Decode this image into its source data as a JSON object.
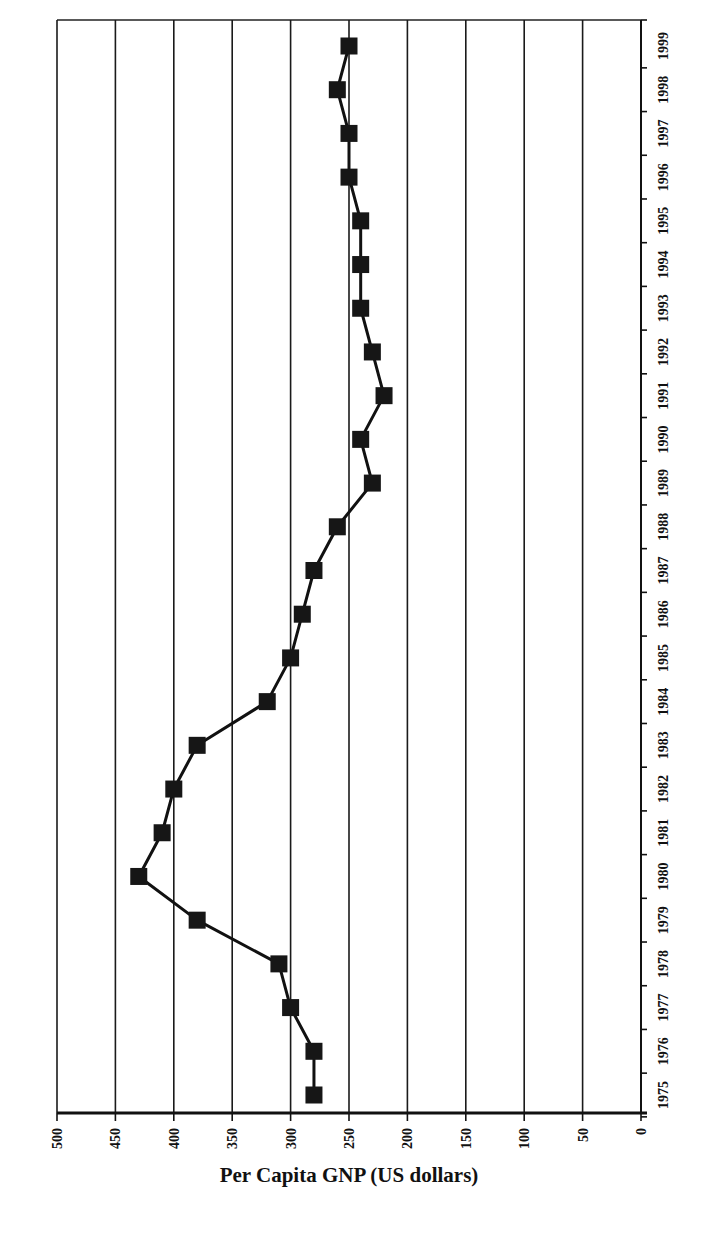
{
  "chart_data": {
    "type": "line",
    "orientation": "rotated-90",
    "title": "",
    "xlabel": "Per Capita GNP (US dollars)",
    "ylabel": "",
    "value_axis": {
      "label": "Per Capita GNP (US dollars)",
      "range": [
        0,
        500
      ],
      "reversed": true,
      "ticks": [
        500,
        450,
        400,
        350,
        300,
        250,
        200,
        150,
        100,
        50,
        0
      ]
    },
    "category_axis": {
      "position": "right",
      "categories": [
        "1975",
        "1976",
        "1977",
        "1978",
        "1979",
        "1980",
        "1981",
        "1982",
        "1983",
        "1984",
        "1985",
        "1986",
        "1987",
        "1988",
        "1989",
        "1990",
        "1991",
        "1992",
        "1993",
        "1994",
        "1995",
        "1996",
        "1997",
        "1998",
        "1999"
      ]
    },
    "categories": [
      "1975",
      "1976",
      "1977",
      "1978",
      "1979",
      "1980",
      "1981",
      "1982",
      "1983",
      "1984",
      "1985",
      "1986",
      "1987",
      "1988",
      "1989",
      "1990",
      "1991",
      "1992",
      "1993",
      "1994",
      "1995",
      "1996",
      "1997",
      "1998",
      "1999"
    ],
    "series": [
      {
        "name": "Per Capita GNP",
        "marker": "square",
        "color": "#111111",
        "values": [
          280,
          280,
          300,
          310,
          380,
          430,
          410,
          400,
          380,
          320,
          300,
          290,
          280,
          260,
          230,
          240,
          220,
          230,
          240,
          240,
          240,
          250,
          250,
          260,
          250
        ]
      }
    ],
    "grid": true,
    "legend": null
  },
  "axis_title": "Per Capita GNP (US dollars)"
}
